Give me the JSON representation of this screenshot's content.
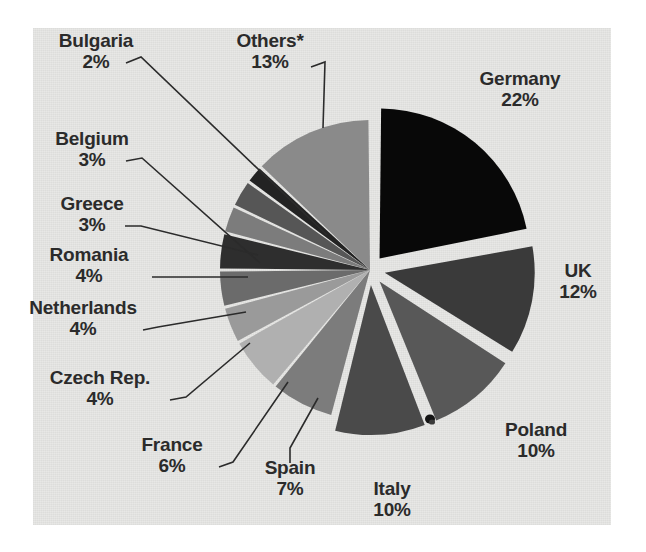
{
  "figure": {
    "background_color": "#e8e8e6",
    "page_color": "#ffffff",
    "text_color": "#2b2b2b",
    "leader_line_color": "#2b2b2b"
  },
  "chart_data": {
    "type": "pie",
    "title": "",
    "subtitle": "",
    "xlabel": "",
    "ylabel": "",
    "legend_position": "none",
    "grid": false,
    "units": "percent",
    "start_angle_deg": 0,
    "direction": "clockwise",
    "footnote_marker": "*",
    "categories": [
      "Germany",
      "UK",
      "Poland",
      "Italy",
      "Spain",
      "France",
      "Czech Rep.",
      "Netherlands",
      "Romania",
      "Greece",
      "Belgium",
      "Bulgaria",
      "Others*"
    ],
    "values": [
      22,
      12,
      10,
      10,
      7,
      6,
      4,
      4,
      4,
      3,
      3,
      2,
      13
    ],
    "value_labels": [
      "22%",
      "12%",
      "10%",
      "10%",
      "7%",
      "6%",
      "4%",
      "4%",
      "4%",
      "3%",
      "3%",
      "2%",
      "13%"
    ],
    "colors": [
      "#080808",
      "#3a3a3a",
      "#585858",
      "#4a4a4a",
      "#7c7c7c",
      "#b0b0b0",
      "#9a9a9a",
      "#6b6b6b",
      "#2e2e2e",
      "#7c7c7c",
      "#565656",
      "#232323",
      "#8a8a8a"
    ],
    "exploded": [
      true,
      true,
      true,
      true,
      false,
      false,
      false,
      false,
      false,
      false,
      false,
      false,
      false
    ]
  },
  "labels": [
    {
      "name": "Germany",
      "value": "22%"
    },
    {
      "name": "UK",
      "value": "12%"
    },
    {
      "name": "Poland",
      "value": "10%"
    },
    {
      "name": "Italy",
      "value": "10%"
    },
    {
      "name": "Spain",
      "value": "7%"
    },
    {
      "name": "France",
      "value": "6%"
    },
    {
      "name": "Czech Rep.",
      "value": "4%"
    },
    {
      "name": "Netherlands",
      "value": "4%"
    },
    {
      "name": "Romania",
      "value": "4%"
    },
    {
      "name": "Greece",
      "value": "3%"
    },
    {
      "name": "Belgium",
      "value": "3%"
    },
    {
      "name": "Bulgaria",
      "value": "2%"
    },
    {
      "name": "Others*",
      "value": "13%"
    }
  ]
}
